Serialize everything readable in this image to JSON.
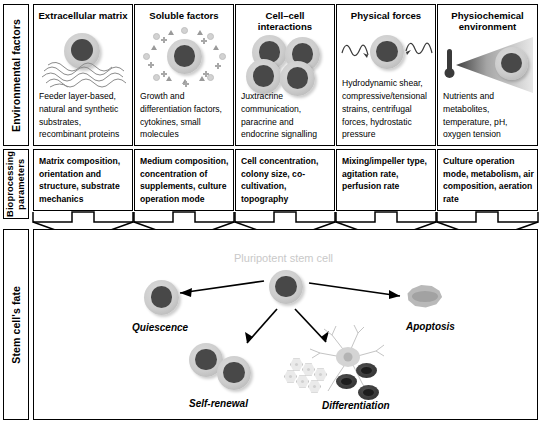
{
  "figure": {
    "row_labels": {
      "environmental": "Environmental factors",
      "bioprocessing": "Bioprocessing\nparameters",
      "bioprocessing_line1": "Bioprocessing",
      "bioprocessing_line2": "parameters",
      "fate": "Stem cell's fate"
    },
    "environmental_factors": [
      {
        "id": "extracellular-matrix",
        "title": "Extracellular matrix",
        "text": "Feeder layer-based, natural and synthetic substrates, recombinant proteins",
        "icon": "cell-on-fiber-matrix-icon"
      },
      {
        "id": "soluble-factors",
        "title": "Soluble factors",
        "text": "Growth and differentiation factors, cytokines, small molecules",
        "icon": "cell-with-soluble-molecules-icon"
      },
      {
        "id": "cell-cell-interactions",
        "title": "Cell–cell interactions",
        "text": "Juxtracrine communication, paracrine and endocrine signalling",
        "icon": "cell-cluster-icon"
      },
      {
        "id": "physical-forces",
        "title": "Physical forces",
        "text": "Hydrodynamic shear, compressive/tensional strains, centrifugal forces, hydrostatic pressure",
        "icon": "cell-with-shear-waves-icon"
      },
      {
        "id": "physiochemical-environment",
        "title": "Physiochemical environment",
        "text": "Nutrients and metabolites, temperature, pH, oxygen tension",
        "icon": "thermometer-gradient-cell-icon"
      }
    ],
    "bioprocessing_parameters": [
      {
        "id": "matrix-composition",
        "text": "Matrix composition, orientation and structure, substrate mechanics"
      },
      {
        "id": "medium-composition",
        "text": "Medium composition, concentration of supplements, culture operation mode"
      },
      {
        "id": "cell-concentration",
        "text": "Cell concentration, colony size, co-cultivation, topography"
      },
      {
        "id": "mixing-impeller",
        "text": "Mixing/impeller type, agitation rate, perfusion rate"
      },
      {
        "id": "culture-operation",
        "text": "Culture operation mode, metabolism, air composition, aeration rate"
      }
    ],
    "stem_cell_fate": {
      "center_label": "Pluripotent stem cell",
      "outcomes": [
        {
          "id": "quiescence",
          "label": "Quiescence",
          "icon": "single-cell-icon"
        },
        {
          "id": "self-renewal",
          "label": "Self-renewal",
          "icon": "two-cells-icon"
        },
        {
          "id": "differentiation",
          "label": "Differentiation",
          "icon": "neuron-epithelial-blood-cells-icon"
        },
        {
          "id": "apoptosis",
          "label": "Apoptosis",
          "icon": "shrunken-cell-icon"
        }
      ]
    },
    "colors": {
      "outline": "#000000",
      "cell_nucleus": "#484848",
      "cell_cytoplasm": "#cccccc",
      "center_label": "#c9c9c9",
      "background": "#ffffff"
    }
  }
}
